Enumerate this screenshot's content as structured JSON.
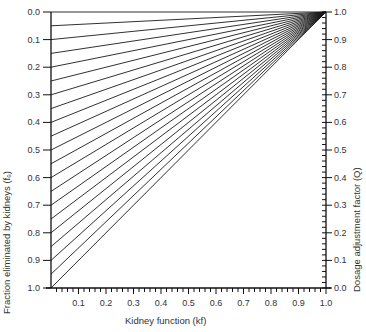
{
  "chart_data": {
    "type": "line",
    "title": "",
    "xlabel": "Kidney function (kf)",
    "ylabel_left": "Fraction eliminated by kidneys (fₑ)",
    "ylabel_right": "Dosage adjustment factor (Q)",
    "xlim": [
      0.0,
      1.0
    ],
    "ylim_left": [
      0.0,
      1.0
    ],
    "ylim_left_inverted": true,
    "ylim_right": [
      0.0,
      1.0
    ],
    "x_ticks": [
      "0.1",
      "0.2",
      "0.3",
      "0.4",
      "0.5",
      "0.6",
      "0.7",
      "0.8",
      "0.9",
      "1.0"
    ],
    "x_minor_step": 0.02,
    "left_ticks": [
      "0.0",
      "0.1",
      "0.2",
      "0.3",
      "0.4",
      "0.5",
      "0.6",
      "0.7",
      "0.8",
      "0.9",
      "1.0"
    ],
    "right_ticks": [
      "1.0",
      "0.9",
      "0.8",
      "0.7",
      "0.6",
      "0.5",
      "0.4",
      "0.3",
      "0.2",
      "0.1",
      "0.0"
    ],
    "right_minor_step": 0.02,
    "grid": false,
    "legend": null,
    "convergence_point": {
      "kf": 1.0,
      "Q": 1.0
    },
    "fe_values": [
      0.0,
      0.05,
      0.1,
      0.15,
      0.2,
      0.25,
      0.3,
      0.35,
      0.4,
      0.45,
      0.5,
      0.55,
      0.6,
      0.65,
      0.7,
      0.75,
      0.8,
      0.85,
      0.9,
      0.95,
      1.0
    ],
    "series_formula": "Q = 1 - fe * (1 - kf)",
    "series": [
      {
        "name": "fe=0.00",
        "x": [
          0,
          1
        ],
        "y": [
          1.0,
          1.0
        ]
      },
      {
        "name": "fe=0.05",
        "x": [
          0,
          1
        ],
        "y": [
          0.95,
          1.0
        ]
      },
      {
        "name": "fe=0.10",
        "x": [
          0,
          1
        ],
        "y": [
          0.9,
          1.0
        ]
      },
      {
        "name": "fe=0.15",
        "x": [
          0,
          1
        ],
        "y": [
          0.85,
          1.0
        ]
      },
      {
        "name": "fe=0.20",
        "x": [
          0,
          1
        ],
        "y": [
          0.8,
          1.0
        ]
      },
      {
        "name": "fe=0.25",
        "x": [
          0,
          1
        ],
        "y": [
          0.75,
          1.0
        ]
      },
      {
        "name": "fe=0.30",
        "x": [
          0,
          1
        ],
        "y": [
          0.7,
          1.0
        ]
      },
      {
        "name": "fe=0.35",
        "x": [
          0,
          1
        ],
        "y": [
          0.65,
          1.0
        ]
      },
      {
        "name": "fe=0.40",
        "x": [
          0,
          1
        ],
        "y": [
          0.6,
          1.0
        ]
      },
      {
        "name": "fe=0.45",
        "x": [
          0,
          1
        ],
        "y": [
          0.55,
          1.0
        ]
      },
      {
        "name": "fe=0.50",
        "x": [
          0,
          1
        ],
        "y": [
          0.5,
          1.0
        ]
      },
      {
        "name": "fe=0.55",
        "x": [
          0,
          1
        ],
        "y": [
          0.45,
          1.0
        ]
      },
      {
        "name": "fe=0.60",
        "x": [
          0,
          1
        ],
        "y": [
          0.4,
          1.0
        ]
      },
      {
        "name": "fe=0.65",
        "x": [
          0,
          1
        ],
        "y": [
          0.35,
          1.0
        ]
      },
      {
        "name": "fe=0.70",
        "x": [
          0,
          1
        ],
        "y": [
          0.3,
          1.0
        ]
      },
      {
        "name": "fe=0.75",
        "x": [
          0,
          1
        ],
        "y": [
          0.25,
          1.0
        ]
      },
      {
        "name": "fe=0.80",
        "x": [
          0,
          1
        ],
        "y": [
          0.2,
          1.0
        ]
      },
      {
        "name": "fe=0.85",
        "x": [
          0,
          1
        ],
        "y": [
          0.15,
          1.0
        ]
      },
      {
        "name": "fe=0.90",
        "x": [
          0,
          1
        ],
        "y": [
          0.1,
          1.0
        ]
      },
      {
        "name": "fe=0.95",
        "x": [
          0,
          1
        ],
        "y": [
          0.05,
          1.0
        ]
      },
      {
        "name": "fe=1.00",
        "x": [
          0,
          1
        ],
        "y": [
          0.0,
          1.0
        ]
      }
    ]
  },
  "layout": {
    "plot_left": 51,
    "plot_right": 326,
    "plot_top": 12,
    "plot_bottom": 288,
    "line_color": "#1a1a1a",
    "background": "#ffffff"
  }
}
